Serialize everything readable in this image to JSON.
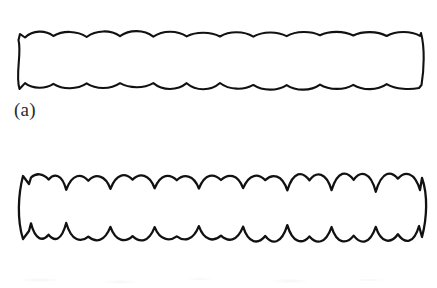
{
  "document": {
    "type": "scanned-figure-page",
    "background_color": "#ffffff",
    "ink_color": "#111111",
    "width": 437,
    "height": 288
  },
  "panels": [
    {
      "id": "a",
      "label": "(a)",
      "description": "Elongated horizontal band with shallow scalloped (wavy) upper and lower borders",
      "scallop_count": 12,
      "bounds": {
        "x": 20,
        "y": 32,
        "width": 400,
        "height": 56
      }
    },
    {
      "id": "b",
      "label": "(b)",
      "description": "Elongated horizontal band with compound scalloped borders: paired lobes separated by deep cusps",
      "scallop_count": 9,
      "bounds": {
        "x": 22,
        "y": 175,
        "width": 398,
        "height": 65
      }
    }
  ],
  "colors": {
    "ink": "#111111",
    "label_text": "#2b2b2b",
    "paper": "#ffffff"
  }
}
